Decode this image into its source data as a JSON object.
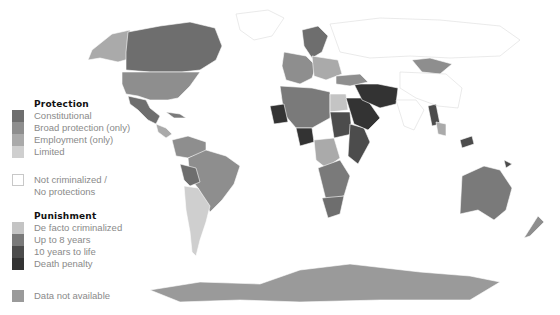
{
  "map": {
    "projection": "world",
    "colors": {
      "constitutional": "#6e6e6e",
      "broad_protection": "#8e8e8e",
      "employment": "#aaaaaa",
      "limited": "#cfcfcf",
      "not_criminalized": "#ffffff",
      "de_facto": "#c4c4c4",
      "up_to_8": "#7a7a7a",
      "ten_to_life": "#4c4c4c",
      "death_penalty": "#333333",
      "no_data": "#9a9a9a",
      "border": "#ffffff"
    },
    "regions": [
      {
        "name": "Alaska",
        "category": "employment"
      },
      {
        "name": "Canada",
        "category": "constitutional"
      },
      {
        "name": "United States",
        "category": "broad_protection"
      },
      {
        "name": "Mexico",
        "category": "constitutional"
      },
      {
        "name": "Central America",
        "category": "employment"
      },
      {
        "name": "Caribbean",
        "category": "up_to_8"
      },
      {
        "name": "Colombia & Venezuela",
        "category": "broad_protection"
      },
      {
        "name": "Brazil",
        "category": "broad_protection"
      },
      {
        "name": "Bolivia",
        "category": "constitutional"
      },
      {
        "name": "Argentina & Chile",
        "category": "limited"
      },
      {
        "name": "Greenland",
        "category": "not_criminalized"
      },
      {
        "name": "Scandinavia",
        "category": "constitutional"
      },
      {
        "name": "Western Europe",
        "category": "broad_protection"
      },
      {
        "name": "Eastern Europe",
        "category": "employment"
      },
      {
        "name": "Russia",
        "category": "not_criminalized"
      },
      {
        "name": "North Africa",
        "category": "up_to_8"
      },
      {
        "name": "Mauritania",
        "category": "death_penalty"
      },
      {
        "name": "Nigeria",
        "category": "death_penalty"
      },
      {
        "name": "Egypt",
        "category": "de_facto"
      },
      {
        "name": "Sudan",
        "category": "ten_to_life"
      },
      {
        "name": "East Africa",
        "category": "ten_to_life"
      },
      {
        "name": "Central Africa",
        "category": "employment"
      },
      {
        "name": "Southern Africa",
        "category": "up_to_8"
      },
      {
        "name": "South Africa",
        "category": "constitutional"
      },
      {
        "name": "Saudi Arabia",
        "category": "death_penalty"
      },
      {
        "name": "Iran & Afghanistan",
        "category": "death_penalty"
      },
      {
        "name": "Turkey & Caucasus",
        "category": "broad_protection"
      },
      {
        "name": "Mongolia",
        "category": "broad_protection"
      },
      {
        "name": "China",
        "category": "not_criminalized"
      },
      {
        "name": "India",
        "category": "not_criminalized"
      },
      {
        "name": "Myanmar",
        "category": "ten_to_life"
      },
      {
        "name": "Southeast Asia",
        "category": "employment"
      },
      {
        "name": "Malaysia",
        "category": "ten_to_life"
      },
      {
        "name": "Australia",
        "category": "up_to_8"
      },
      {
        "name": "New Zealand",
        "category": "broad_protection"
      },
      {
        "name": "Papua New Guinea",
        "category": "ten_to_life"
      },
      {
        "name": "Antarctica",
        "category": "no_data"
      }
    ]
  },
  "legend": {
    "protection": {
      "title": "Protection",
      "items": [
        {
          "label": "Constitutional",
          "color": "#6e6e6e"
        },
        {
          "label": "Broad protection (only)",
          "color": "#8e8e8e"
        },
        {
          "label": "Employment (only)",
          "color": "#aaaaaa"
        },
        {
          "label": "Limited",
          "color": "#cfcfcf"
        }
      ]
    },
    "not_criminalized": {
      "line1": "Not criminalized /",
      "line2": "No protections",
      "color": "#ffffff"
    },
    "punishment": {
      "title": "Punishment",
      "items": [
        {
          "label": "De facto criminalized",
          "color": "#c4c4c4"
        },
        {
          "label": "Up to 8 years",
          "color": "#7a7a7a"
        },
        {
          "label": "10 years to life",
          "color": "#4c4c4c"
        },
        {
          "label": "Death penalty",
          "color": "#333333"
        }
      ]
    },
    "no_data": {
      "label": "Data not available",
      "color": "#9a9a9a"
    }
  }
}
